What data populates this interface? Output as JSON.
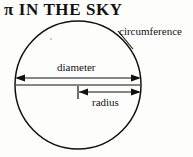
{
  "page": {
    "background_color": "#fdfdfb",
    "ink_color": "#111111",
    "width": 193,
    "height": 157
  },
  "title": {
    "text": "π IN THE SKY"
  },
  "diagram": {
    "type": "circle-geometry",
    "shape_name": "circle-outline",
    "circle": {
      "center_x": 78,
      "center_y": 85,
      "radius_x": 63,
      "radius_y": 64,
      "stroke_color": "#111111",
      "stroke_width": 1.4
    },
    "labels": [
      {
        "id": "circumference",
        "text": "circumference",
        "refers_to": "circle-outline"
      },
      {
        "id": "diameter",
        "text": "diameter",
        "refers_to": "diameter-arrow"
      },
      {
        "id": "radius",
        "text": "radius",
        "refers_to": "radius-arrow"
      }
    ],
    "leader_line": {
      "name": "circumference-leader-line",
      "from_x": 117,
      "from_y": 30,
      "to_x": 132,
      "to_y": 48
    },
    "measures": [
      {
        "id": "diameter-arrow",
        "style": "double-headed-arrow",
        "x1": 16,
        "x2": 140,
        "y": 78
      },
      {
        "id": "chord-line",
        "style": "plain-line",
        "x1": 16,
        "x2": 140,
        "y": 85
      },
      {
        "id": "radius-arrow",
        "style": "tick-and-arrow",
        "x1": 78,
        "x2": 140,
        "y": 92
      }
    ]
  }
}
